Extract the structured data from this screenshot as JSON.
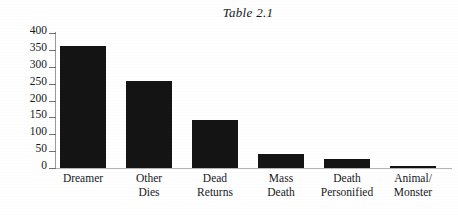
{
  "chart_data": {
    "type": "bar",
    "title": "Table 2.1",
    "xlabel": "",
    "ylabel": "",
    "categories": [
      "Dreamer",
      "Other Dies",
      "Dead Returns",
      "Mass Death",
      "Death Personified",
      "Animal/ Monster"
    ],
    "category_lines": [
      [
        "Dreamer",
        ""
      ],
      [
        "Other",
        "Dies"
      ],
      [
        "Dead",
        "Returns"
      ],
      [
        "Mass",
        "Death"
      ],
      [
        "Death",
        "Personified"
      ],
      [
        "Animal/",
        "Monster"
      ]
    ],
    "values": [
      363,
      257,
      143,
      43,
      27,
      5
    ],
    "ylim": [
      0,
      400
    ],
    "yticks": [
      400,
      350,
      300,
      250,
      200,
      150,
      100,
      50,
      0
    ],
    "ytick_labels": [
      "400",
      "350",
      "300",
      "250",
      "200",
      "150",
      "100",
      "50",
      "0"
    ],
    "grid": false,
    "legend": null,
    "bar_color": "#141414",
    "axis_color": "#9a9a9a",
    "background_color": "#ffffff"
  }
}
